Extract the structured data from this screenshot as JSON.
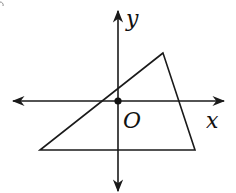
{
  "diagram": {
    "labels": {
      "y_axis": "y",
      "x_axis": "x",
      "origin": "O"
    },
    "colors": {
      "stroke": "#1a1a1a",
      "background": "#ffffff"
    },
    "triangle_vertices_px": [
      [
        163,
        53
      ],
      [
        40,
        150
      ],
      [
        195,
        150
      ]
    ]
  }
}
